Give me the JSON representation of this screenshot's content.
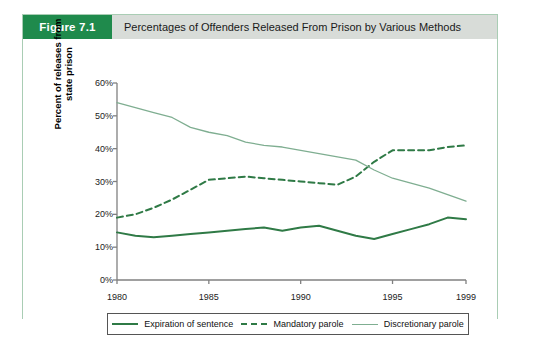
{
  "figure": {
    "tag": "Figure 7.1",
    "title": "Percentages of Offenders Released From Prison by Various Methods"
  },
  "colors": {
    "tag_background": "#1f8a4c",
    "header_background": "#d8dcd8",
    "card_border": "#a9cdb4",
    "expiration_line": "#2f7a46",
    "mandatory_line": "#2f7a46",
    "discretionary_line": "#7fae91",
    "axis": "#808080"
  },
  "legend": {
    "position": "bottom",
    "items": [
      {
        "label": "Expiration of sentence",
        "style": "solid",
        "color": "#2f7a46"
      },
      {
        "label": "Mandatory parole",
        "style": "dashed",
        "color": "#2f7a46"
      },
      {
        "label": "Discretionary parole",
        "style": "thin-solid",
        "color": "#7fae91"
      }
    ]
  },
  "chart_data": {
    "type": "line",
    "title": "Percentages of Offenders Released From Prison by Various Methods",
    "xlabel": "",
    "ylabel": "Percent of releases from state prison",
    "xlim": [
      1980,
      1999
    ],
    "ylim": [
      0,
      60
    ],
    "grid": false,
    "legend_position": "bottom",
    "x_tick_labels": [
      "1980",
      "1985",
      "1990",
      "1995",
      "1999"
    ],
    "x_tick_values": [
      1980,
      1985,
      1990,
      1995,
      1999
    ],
    "y_tick_labels": [
      "0%",
      "10%",
      "20%",
      "30%",
      "40%",
      "50%",
      "60%"
    ],
    "y_tick_values": [
      0,
      10,
      20,
      30,
      40,
      50,
      60
    ],
    "x": [
      1980,
      1981,
      1982,
      1983,
      1984,
      1985,
      1986,
      1987,
      1988,
      1989,
      1990,
      1991,
      1992,
      1993,
      1994,
      1995,
      1996,
      1997,
      1998,
      1999
    ],
    "series": [
      {
        "name": "Expiration of sentence",
        "style": "solid",
        "color": "#2f7a46",
        "values": [
          14.5,
          13.5,
          13.0,
          13.5,
          14.0,
          14.5,
          15.0,
          15.5,
          16.0,
          15.0,
          16.0,
          16.5,
          15.0,
          13.5,
          12.5,
          14.0,
          15.5,
          17.0,
          19.0,
          18.5
        ]
      },
      {
        "name": "Mandatory parole",
        "style": "dashed",
        "color": "#2f7a46",
        "values": [
          19.0,
          20.0,
          22.0,
          24.5,
          27.5,
          30.5,
          31.0,
          31.5,
          31.0,
          30.5,
          30.0,
          29.5,
          29.0,
          31.5,
          36.0,
          39.5,
          39.5,
          39.5,
          40.5,
          41.0
        ]
      },
      {
        "name": "Discretionary parole",
        "style": "thin-solid",
        "color": "#7fae91",
        "values": [
          54.0,
          52.5,
          51.0,
          49.5,
          46.5,
          45.0,
          44.0,
          42.0,
          41.0,
          40.5,
          39.5,
          38.5,
          37.5,
          36.5,
          33.5,
          31.0,
          29.5,
          28.0,
          26.0,
          24.0
        ]
      }
    ]
  }
}
